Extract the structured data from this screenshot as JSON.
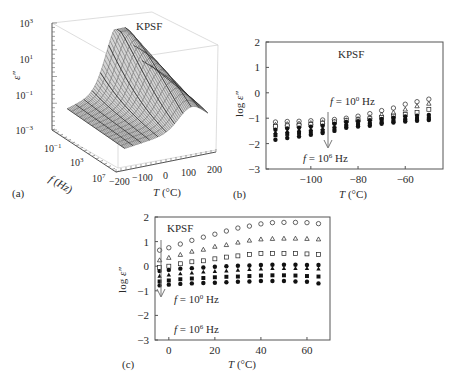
{
  "figure": {
    "panels": [
      {
        "label": "(a)"
      },
      {
        "label": "(b)"
      },
      {
        "label": "(c)"
      }
    ]
  },
  "chart_data": [
    {
      "id": "a",
      "type": "surface3d",
      "title": "KPSF",
      "panel_label": "(a)",
      "zlabel": "ε″",
      "xlabel": "T (°C)",
      "ylabel": "f (Hz)",
      "z_ticks": [
        "10^3",
        "10^1",
        "10^-1",
        "10^-3"
      ],
      "x_ticks": [
        "-200",
        "-100",
        "0",
        "100",
        "200"
      ],
      "y_ticks": [
        "10^-1",
        "10^3",
        "10^7"
      ],
      "z_scale": "log",
      "zlim": [
        0.001,
        1000
      ],
      "xlim": [
        -200,
        200
      ],
      "ylim": [
        0.1,
        10000000
      ],
      "description": "Wireframe surface of dielectric loss ε″ vs temperature and frequency; peak ≈10^2 near T≈100°C at low frequency, decreasing toward low T and high f"
    },
    {
      "id": "b",
      "type": "scatter",
      "title": "KPSF",
      "panel_label": "(b)",
      "xlabel": "T (°C)",
      "ylabel": "log ε″",
      "xlim": [
        -119,
        -44
      ],
      "ylim": [
        -3,
        2
      ],
      "x_ticks": [
        -100,
        -80,
        -60
      ],
      "y_ticks": [
        2,
        1,
        0,
        -1,
        -2,
        -3
      ],
      "annotations": [
        "f = 10^0 Hz",
        "f = 10^6 Hz"
      ],
      "arrow": "downward, increasing frequency",
      "x": [
        -115,
        -110,
        -105,
        -100,
        -95,
        -90,
        -85,
        -80,
        -75,
        -70,
        -65,
        -60,
        -55,
        -50
      ],
      "series": [
        {
          "name": "10^0 Hz",
          "marker": "open-circle",
          "values": [
            -1.15,
            -1.13,
            -1.12,
            -1.1,
            -1.07,
            -1.05,
            -1.0,
            -0.92,
            -0.82,
            -0.7,
            -0.6,
            -0.45,
            -0.35,
            -0.25
          ]
        },
        {
          "name": "10^1 Hz",
          "marker": "open-triangle",
          "values": [
            -1.25,
            -1.22,
            -1.2,
            -1.18,
            -1.15,
            -1.12,
            -1.07,
            -1.02,
            -0.95,
            -0.85,
            -0.77,
            -0.65,
            -0.52,
            -0.42
          ]
        },
        {
          "name": "10^2 Hz",
          "marker": "open-square",
          "values": [
            -1.33,
            -1.3,
            -1.28,
            -1.25,
            -1.2,
            -1.15,
            -1.1,
            -1.07,
            -1.02,
            -0.97,
            -0.92,
            -0.85,
            -0.77,
            -0.65
          ]
        },
        {
          "name": "10^3 Hz",
          "marker": "filled-circle",
          "values": [
            -1.45,
            -1.4,
            -1.37,
            -1.33,
            -1.3,
            -1.22,
            -1.15,
            -1.12,
            -1.08,
            -1.03,
            -0.98,
            -0.93,
            -0.9,
            -0.87
          ]
        },
        {
          "name": "10^4 Hz",
          "marker": "filled-triangle",
          "values": [
            -1.55,
            -1.5,
            -1.45,
            -1.43,
            -1.4,
            -1.32,
            -1.22,
            -1.18,
            -1.15,
            -1.1,
            -1.05,
            -1.0,
            -0.97,
            -0.93
          ]
        },
        {
          "name": "10^5 Hz",
          "marker": "filled-square",
          "values": [
            -1.67,
            -1.62,
            -1.58,
            -1.53,
            -1.5,
            -1.4,
            -1.3,
            -1.25,
            -1.22,
            -1.15,
            -1.1,
            -1.07,
            -1.03,
            -1.0
          ]
        },
        {
          "name": "10^6 Hz",
          "marker": "filled-circle",
          "values": [
            -1.85,
            -1.78,
            -1.72,
            -1.65,
            -1.58,
            -1.5,
            -1.38,
            -1.33,
            -1.3,
            -1.22,
            -1.17,
            -1.13,
            -1.1,
            -1.07
          ]
        }
      ]
    },
    {
      "id": "c",
      "type": "scatter",
      "title": "KPSF",
      "panel_label": "(c)",
      "xlabel": "T (°C)",
      "ylabel": "log ε″",
      "xlim": [
        -6,
        70
      ],
      "ylim": [
        -3,
        2
      ],
      "x_ticks": [
        0,
        20,
        40,
        60
      ],
      "y_ticks": [
        2,
        1,
        0,
        -1,
        -2,
        -3
      ],
      "annotations": [
        "f = 10^0 Hz",
        "f = 10^6 Hz"
      ],
      "arrow": "downward, increasing frequency",
      "x": [
        -4,
        0,
        5,
        10,
        15,
        20,
        25,
        30,
        35,
        40,
        45,
        50,
        55,
        60,
        65
      ],
      "series": [
        {
          "name": "10^0 Hz",
          "marker": "open-circle",
          "values": [
            0.65,
            0.75,
            0.9,
            1.05,
            1.18,
            1.3,
            1.43,
            1.55,
            1.63,
            1.72,
            1.77,
            1.78,
            1.78,
            1.77,
            1.73
          ]
        },
        {
          "name": "10^1 Hz",
          "marker": "open-triangle",
          "values": [
            0.25,
            0.35,
            0.47,
            0.6,
            0.68,
            0.8,
            0.87,
            0.97,
            1.05,
            1.1,
            1.12,
            1.13,
            1.13,
            1.12,
            1.1
          ]
        },
        {
          "name": "10^2 Hz",
          "marker": "open-square",
          "values": [
            -0.05,
            0.0,
            0.1,
            0.18,
            0.22,
            0.3,
            0.37,
            0.42,
            0.48,
            0.52,
            0.52,
            0.52,
            0.52,
            0.5,
            0.48
          ]
        },
        {
          "name": "10^3 Hz",
          "marker": "filled-circle",
          "values": [
            -0.2,
            -0.15,
            -0.1,
            -0.08,
            -0.05,
            -0.02,
            0.0,
            0.02,
            0.03,
            0.05,
            0.06,
            0.06,
            0.06,
            0.05,
            0.05
          ]
        },
        {
          "name": "10^4 Hz",
          "marker": "filled-triangle",
          "values": [
            -0.4,
            -0.35,
            -0.3,
            -0.27,
            -0.23,
            -0.2,
            -0.18,
            -0.15,
            -0.12,
            -0.1,
            -0.08,
            -0.08,
            -0.08,
            -0.08,
            -0.1
          ]
        },
        {
          "name": "10^5 Hz",
          "marker": "filled-square",
          "values": [
            -0.62,
            -0.58,
            -0.53,
            -0.5,
            -0.48,
            -0.45,
            -0.43,
            -0.42,
            -0.4,
            -0.38,
            -0.37,
            -0.37,
            -0.38,
            -0.4,
            -0.42
          ]
        },
        {
          "name": "10^6 Hz",
          "marker": "filled-circle",
          "values": [
            -0.78,
            -0.75,
            -0.72,
            -0.7,
            -0.68,
            -0.67,
            -0.65,
            -0.63,
            -0.62,
            -0.6,
            -0.6,
            -0.6,
            -0.62,
            -0.63,
            -0.7
          ]
        }
      ]
    }
  ]
}
